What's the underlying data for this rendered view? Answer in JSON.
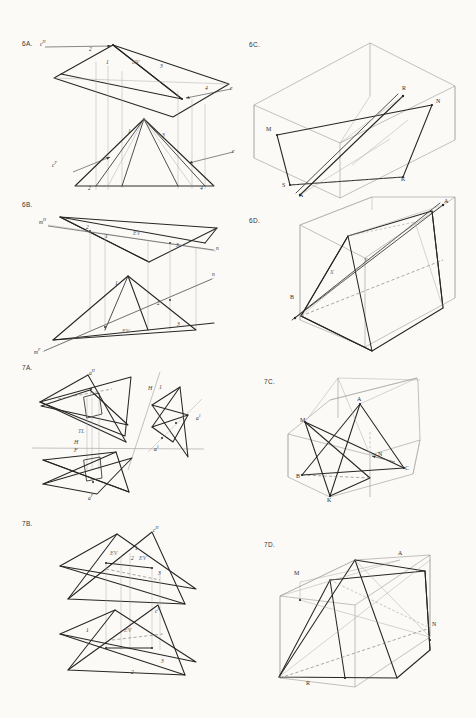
{
  "sheet": {
    "title": "Descriptive Geometry Worksheet Page",
    "background_color": "#fbfaf7",
    "ink_color": "#2b2b2b",
    "construction_color": "#9a9a9a",
    "hidden_color": "#8a8a8a"
  },
  "problems": [
    {
      "id": "6A",
      "number_label": "6A.",
      "type": "orthographic-two-view",
      "description": "Horizontal and frontal views of an oblique plane with edge view located",
      "labels": [
        {
          "name": "point-c-h",
          "text": "c",
          "sup": "H"
        },
        {
          "name": "point-c-f",
          "text": "c",
          "sup": "F"
        },
        {
          "name": "point-e-top",
          "text": "e",
          "sup": ""
        },
        {
          "name": "point-e-bottom",
          "text": "e",
          "sup": ""
        },
        {
          "name": "edge-view-top",
          "text": "EV",
          "sup": ""
        },
        {
          "name": "point-1-top",
          "text": "1",
          "sup": ""
        },
        {
          "name": "point-2-top",
          "text": "2",
          "sup": ""
        },
        {
          "name": "point-3-top",
          "text": "3",
          "sup": ""
        },
        {
          "name": "point-4-top",
          "text": "4",
          "sup": ""
        },
        {
          "name": "point-1-bottom",
          "text": "1",
          "sup": ""
        },
        {
          "name": "point-2-bottom",
          "text": "2",
          "sup": ""
        },
        {
          "name": "point-3-bottom",
          "text": "3",
          "sup": ""
        },
        {
          "name": "point-4-bottom",
          "text": "4",
          "sup": ""
        }
      ]
    },
    {
      "id": "6B",
      "number_label": "6B.",
      "type": "orthographic-two-view",
      "description": "Horizontal and frontal views of a plane with line m-n and edge views",
      "labels": [
        {
          "name": "point-m-h",
          "text": "m",
          "sup": "H"
        },
        {
          "name": "point-m-f",
          "text": "m",
          "sup": "F"
        },
        {
          "name": "point-n-top",
          "text": "n",
          "sup": ""
        },
        {
          "name": "point-n-bottom",
          "text": "n",
          "sup": ""
        },
        {
          "name": "edge-view-top",
          "text": "EV",
          "sup": ""
        },
        {
          "name": "edge-view-bottom",
          "text": "EV",
          "sup": ""
        },
        {
          "name": "point-1-top",
          "text": "1",
          "sup": ""
        },
        {
          "name": "point-2-top",
          "text": "2",
          "sup": ""
        },
        {
          "name": "point-3-top",
          "text": "3",
          "sup": ""
        },
        {
          "name": "point-1-bottom",
          "text": "1",
          "sup": ""
        },
        {
          "name": "point-2-bottom",
          "text": "2",
          "sup": ""
        },
        {
          "name": "point-3-bottom",
          "text": "3",
          "sup": ""
        }
      ]
    },
    {
      "id": "6C",
      "number_label": "6C.",
      "type": "pictorial-box",
      "description": "Pictorial projection box containing plane MNKS pierced by line A-R",
      "labels": [
        {
          "name": "point-m",
          "text": "M",
          "sup": ""
        },
        {
          "name": "point-n",
          "text": "N",
          "sup": ""
        },
        {
          "name": "point-r",
          "text": "R",
          "sup": ""
        },
        {
          "name": "point-k",
          "text": "K",
          "sup": ""
        },
        {
          "name": "point-s",
          "text": "S",
          "sup": ""
        },
        {
          "name": "point-a",
          "text": "A",
          "sup": ""
        }
      ]
    },
    {
      "id": "6D",
      "number_label": "6D.",
      "type": "pictorial-box",
      "description": "Pictorial projection box with plane and line A-B piercing point",
      "labels": [
        {
          "name": "point-a",
          "text": "A",
          "sup": ""
        },
        {
          "name": "point-b",
          "text": "B",
          "sup": ""
        },
        {
          "name": "point-x",
          "text": "X",
          "sup": ""
        },
        {
          "name": "point-y",
          "text": "Y",
          "sup": ""
        }
      ]
    },
    {
      "id": "7A",
      "number_label": "7A.",
      "type": "orthographic-auxiliary",
      "description": "Horizontal, frontal and auxiliary views of two intersecting planes with point a",
      "labels": [
        {
          "name": "point-a-h",
          "text": "a",
          "sup": "H"
        },
        {
          "name": "point-a-f",
          "text": "a",
          "sup": "F"
        },
        {
          "name": "point-a-1",
          "text": "a",
          "sup": "1"
        },
        {
          "name": "point-a-1-lower",
          "text": "a",
          "sup": "1"
        },
        {
          "name": "fold-line-hf",
          "text": "H",
          "sup": ""
        },
        {
          "name": "fold-line-hf-lower",
          "text": "F",
          "sup": ""
        },
        {
          "name": "fold-line-h1",
          "text": "H",
          "sup": ""
        },
        {
          "name": "fold-line-h1-right",
          "text": "1",
          "sup": ""
        },
        {
          "name": "true-length",
          "text": "TL",
          "sup": ""
        }
      ]
    },
    {
      "id": "7B",
      "number_label": "7B.",
      "type": "orthographic-two-view",
      "description": "Horizontal and frontal views of two intersecting planes showing line of intersection with edge views",
      "labels": [
        {
          "name": "point-c-h",
          "text": "c",
          "sup": "H"
        },
        {
          "name": "point-c-f",
          "text": "c",
          "sup": "F"
        },
        {
          "name": "edge-view-top",
          "text": "EV",
          "sup": ""
        },
        {
          "name": "edge-view-top-2",
          "text": "EV",
          "sup": ""
        },
        {
          "name": "edge-view-bottom",
          "text": "EV",
          "sup": ""
        },
        {
          "name": "point-1-top",
          "text": "1",
          "sup": ""
        },
        {
          "name": "point-2-top",
          "text": "2",
          "sup": ""
        },
        {
          "name": "point-3-top",
          "text": "3",
          "sup": ""
        },
        {
          "name": "point-1-bottom",
          "text": "1",
          "sup": ""
        },
        {
          "name": "point-2-bottom",
          "text": "2",
          "sup": ""
        },
        {
          "name": "point-3-bottom",
          "text": "3",
          "sup": ""
        }
      ]
    },
    {
      "id": "7C",
      "number_label": "7C.",
      "type": "pictorial-box",
      "description": "Pictorial hexagonal projection box with triangle ABC and plane MNK intersecting",
      "labels": [
        {
          "name": "point-a",
          "text": "A",
          "sup": ""
        },
        {
          "name": "point-b",
          "text": "B",
          "sup": ""
        },
        {
          "name": "point-c",
          "text": "C",
          "sup": ""
        },
        {
          "name": "point-m",
          "text": "M",
          "sup": ""
        },
        {
          "name": "point-n",
          "text": "N",
          "sup": ""
        },
        {
          "name": "point-k",
          "text": "K",
          "sup": ""
        }
      ]
    },
    {
      "id": "7D",
      "number_label": "7D.",
      "type": "pictorial-box",
      "description": "Pictorial projection box with plane MNR and intersecting surfaces",
      "labels": [
        {
          "name": "point-m",
          "text": "M",
          "sup": ""
        },
        {
          "name": "point-n",
          "text": "N",
          "sup": ""
        },
        {
          "name": "point-r",
          "text": "R",
          "sup": ""
        },
        {
          "name": "point-a",
          "text": "A",
          "sup": ""
        }
      ]
    }
  ]
}
